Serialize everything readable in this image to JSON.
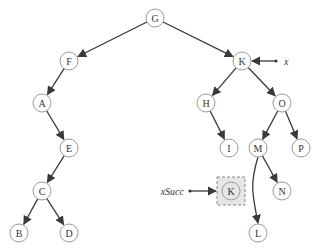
{
  "diagram": {
    "type": "binary-search-tree-successor",
    "colors": {
      "node_stroke": "#9a9a9a",
      "node_fill": "#ffffff",
      "edge": "#3a3a3a",
      "highlight_fill": "#e6e6e6",
      "highlight_box": "#888888"
    },
    "nodes": [
      {
        "id": "G",
        "label": "G",
        "x": 155,
        "y": 18
      },
      {
        "id": "F",
        "label": "F",
        "x": 69,
        "y": 61
      },
      {
        "id": "K",
        "label": "K",
        "x": 242,
        "y": 61
      },
      {
        "id": "A",
        "label": "A",
        "x": 42,
        "y": 103
      },
      {
        "id": "H",
        "label": "H",
        "x": 206,
        "y": 103
      },
      {
        "id": "O",
        "label": "O",
        "x": 282,
        "y": 103
      },
      {
        "id": "E",
        "label": "E",
        "x": 69,
        "y": 148
      },
      {
        "id": "I",
        "label": "I",
        "x": 229,
        "y": 148
      },
      {
        "id": "M",
        "label": "M",
        "x": 258,
        "y": 148
      },
      {
        "id": "P",
        "label": "P",
        "x": 301,
        "y": 148
      },
      {
        "id": "C",
        "label": "C",
        "x": 42,
        "y": 191
      },
      {
        "id": "Ksucc",
        "label": "K",
        "x": 231,
        "y": 191,
        "highlighted": true
      },
      {
        "id": "N",
        "label": "N",
        "x": 282,
        "y": 191
      },
      {
        "id": "B",
        "label": "B",
        "x": 19,
        "y": 233
      },
      {
        "id": "D",
        "label": "D",
        "x": 69,
        "y": 233
      },
      {
        "id": "L",
        "label": "L",
        "x": 258,
        "y": 233
      }
    ],
    "edges": [
      {
        "from": "G",
        "to": "F"
      },
      {
        "from": "G",
        "to": "K"
      },
      {
        "from": "F",
        "to": "A"
      },
      {
        "from": "A",
        "to": "E"
      },
      {
        "from": "E",
        "to": "C"
      },
      {
        "from": "C",
        "to": "B"
      },
      {
        "from": "C",
        "to": "D"
      },
      {
        "from": "K",
        "to": "H"
      },
      {
        "from": "K",
        "to": "O"
      },
      {
        "from": "H",
        "to": "I"
      },
      {
        "from": "O",
        "to": "M"
      },
      {
        "from": "O",
        "to": "P"
      },
      {
        "from": "M",
        "to": "N"
      },
      {
        "from": "M",
        "to": "L",
        "curved": true
      }
    ],
    "pointers": [
      {
        "label": "x",
        "target": "K",
        "side": "right"
      },
      {
        "label": "xSucc",
        "target": "Ksucc",
        "side": "left"
      }
    ]
  }
}
